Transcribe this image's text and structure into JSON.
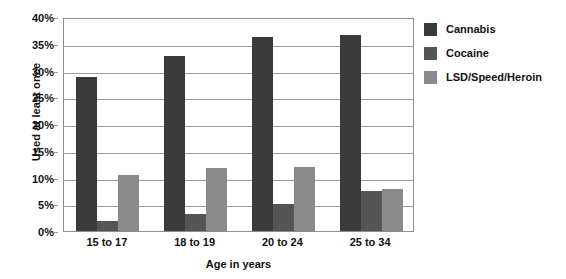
{
  "chart_data": {
    "type": "bar",
    "title": "",
    "xlabel": "Age in years",
    "ylabel": "Used at least once",
    "categories": [
      "15 to 17",
      "18 to 19",
      "20 to 24",
      "25 to 34"
    ],
    "series": [
      {
        "name": "Cannabis",
        "color": "#3a3a3a",
        "values": [
          28.8,
          32.7,
          36.3,
          36.7
        ]
      },
      {
        "name": "Cocaine",
        "color": "#555555",
        "values": [
          1.8,
          3.1,
          5.1,
          7.5
        ]
      },
      {
        "name": "LSD/Speed/Heroin",
        "color": "#8a8a8a",
        "values": [
          10.5,
          11.7,
          12.0,
          7.9
        ]
      }
    ],
    "ylim": [
      0,
      40
    ],
    "yticks": [
      "0%",
      "5%",
      "10%",
      "15%",
      "20%",
      "25%",
      "30%",
      "35%",
      "40%"
    ],
    "ytick_values": [
      0,
      5,
      10,
      15,
      20,
      25,
      30,
      35,
      40
    ],
    "grid": true,
    "legend_position": "right"
  }
}
